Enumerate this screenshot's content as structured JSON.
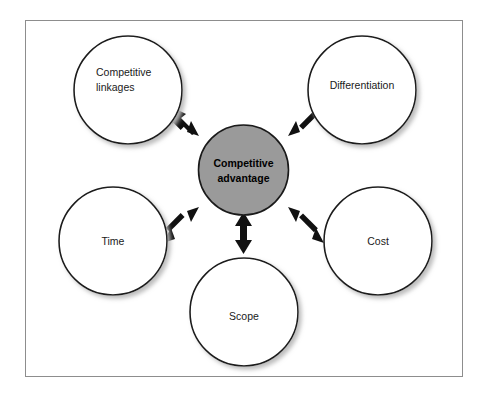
{
  "diagram": {
    "type": "hub-and-spoke",
    "title": "",
    "frame": {
      "border_color": "#8d8d8d",
      "background": "#ffffff"
    },
    "center_node": {
      "id": "competitive-advantage",
      "label_line1": "Competitive",
      "label_line2": "advantage",
      "fill_color": "#9a9a9a",
      "stroke_color": "#1a1a1a",
      "bold": true
    },
    "outer_nodes": [
      {
        "id": "competitive-linkages",
        "label_line1": "Competitive",
        "label_line2": "linkages",
        "position": "top-left",
        "fill_color": "#ffffff",
        "stroke_color": "#1a1a1a"
      },
      {
        "id": "differentiation",
        "label_line1": "Differentiation",
        "label_line2": "",
        "position": "top-right",
        "fill_color": "#ffffff",
        "stroke_color": "#1a1a1a"
      },
      {
        "id": "time",
        "label_line1": "Time",
        "label_line2": "",
        "position": "left",
        "fill_color": "#ffffff",
        "stroke_color": "#1a1a1a"
      },
      {
        "id": "cost",
        "label_line1": "Cost",
        "label_line2": "",
        "position": "right",
        "fill_color": "#ffffff",
        "stroke_color": "#1a1a1a"
      },
      {
        "id": "scope",
        "label_line1": "Scope",
        "label_line2": "",
        "position": "bottom",
        "fill_color": "#ffffff",
        "stroke_color": "#1a1a1a"
      }
    ],
    "connectors": [
      {
        "id": "arrow-center-competitive-linkages",
        "from": "competitive-advantage",
        "to": "competitive-linkages",
        "style": "double-headed",
        "color": "#111111"
      },
      {
        "id": "arrow-center-differentiation",
        "from": "competitive-advantage",
        "to": "differentiation",
        "style": "double-headed",
        "color": "#111111"
      },
      {
        "id": "arrow-center-time",
        "from": "competitive-advantage",
        "to": "time",
        "style": "double-headed",
        "color": "#111111"
      },
      {
        "id": "arrow-center-cost",
        "from": "competitive-advantage",
        "to": "cost",
        "style": "double-headed",
        "color": "#111111"
      },
      {
        "id": "arrow-center-scope",
        "from": "competitive-advantage",
        "to": "scope",
        "style": "double-headed",
        "color": "#111111"
      }
    ]
  }
}
